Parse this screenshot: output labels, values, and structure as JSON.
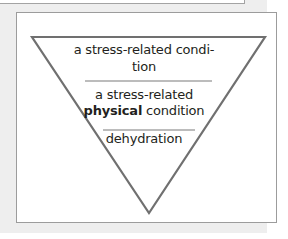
{
  "diagram": {
    "type": "inverted-triangle-hierarchy",
    "colors": {
      "background": "#eeeeee",
      "card": "#ffffff",
      "card_border": "#9c9c9c",
      "triangle_stroke": "#707070",
      "divider": "#707070",
      "text": "#231f20"
    },
    "levels": [
      {
        "line1": "a stress-related condi-",
        "line2": "tion"
      },
      {
        "line1": "a stress-related",
        "line2_bold": "physical",
        "line2_rest": " condition"
      },
      {
        "line1": "dehydration"
      }
    ]
  }
}
